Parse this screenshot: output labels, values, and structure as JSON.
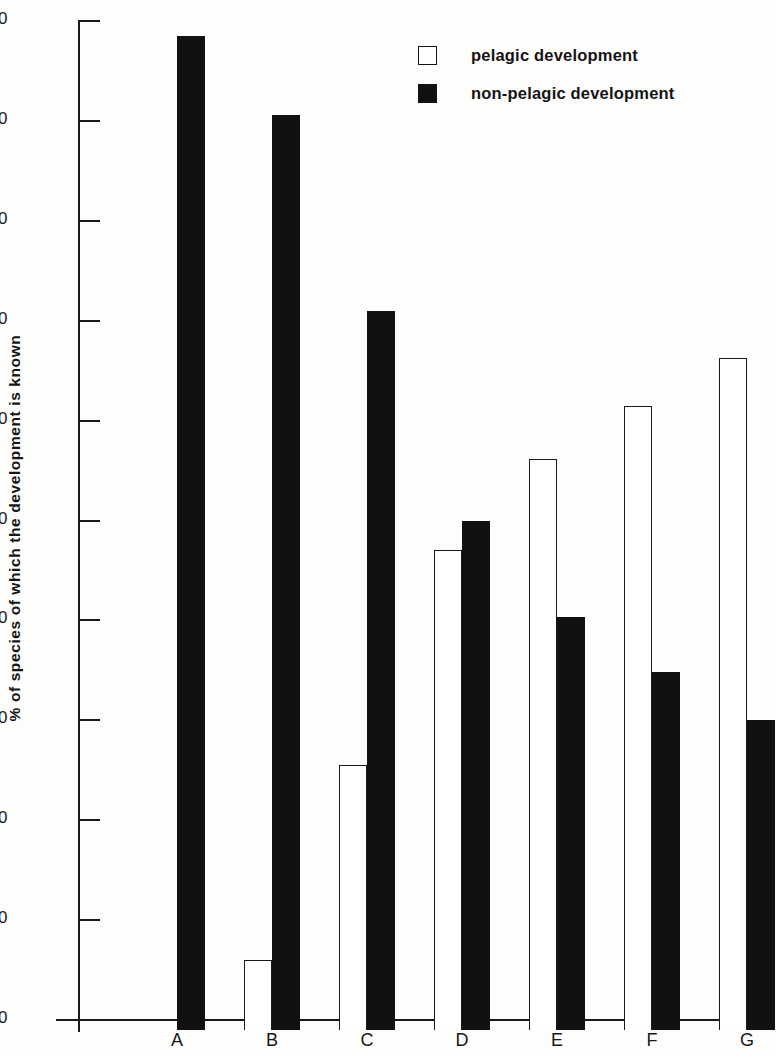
{
  "chart_data": {
    "type": "bar",
    "title": "",
    "subtitle": "",
    "xlabel": "",
    "ylabel": "% of species of which the development is known",
    "categories": [
      "A",
      "B",
      "C",
      "D",
      "E",
      "F",
      "G"
    ],
    "ylim": [
      0,
      100
    ],
    "yticks": [
      0,
      10,
      20,
      30,
      40,
      50,
      60,
      70,
      80,
      90,
      100
    ],
    "ytick_labels": [
      "0",
      "10",
      "20",
      "30",
      "40",
      "50",
      "60",
      "70",
      "80",
      "90",
      "100"
    ],
    "grid": false,
    "legend_position": "top-right",
    "series": [
      {
        "name": "pelagic development",
        "style": "open",
        "color": "#ffffff",
        "edge_color": "#1a1a1a",
        "values": [
          null,
          7.0,
          26.5,
          48.0,
          57.2,
          62.5,
          67.3
        ]
      },
      {
        "name": "non-pelagic development",
        "style": "filled",
        "color": "#111111",
        "edge_color": "#111111",
        "values": [
          99.5,
          91.6,
          72.0,
          51.0,
          41.3,
          35.8,
          31.0
        ]
      }
    ]
  },
  "legend": {
    "items": [
      {
        "label": "pelagic development",
        "style": "open"
      },
      {
        "label": "non-pelagic development",
        "style": "filled"
      }
    ]
  },
  "axes": {
    "y_title": "% of species of which the development is known"
  }
}
